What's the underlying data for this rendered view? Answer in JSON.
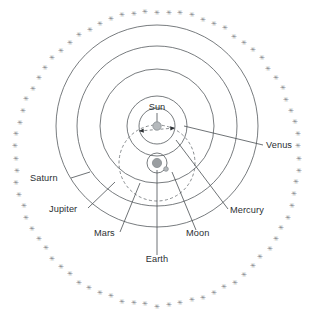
{
  "diagram": {
    "type": "geocentric-heliocentric hybrid orbital diagram",
    "center_x": 157,
    "center_y": 163,
    "sun_x": 157,
    "sun_y": 126,
    "colors": {
      "background": "#ffffff",
      "orbit_stroke": "#555a5e",
      "dashed_stroke": "#6b7074",
      "leader_stroke": "#4a4f53",
      "label_text": "#2b2f33",
      "star_fill": "#7e8286",
      "body_fill": "#b5b9bc",
      "body_stroke": "#8a8f93"
    },
    "labels": [
      {
        "id": "sun",
        "text": "Sun",
        "x": 157,
        "y": 110,
        "anchor": "middle",
        "leader": [
          [
            157,
            113
          ],
          [
            157,
            122
          ]
        ]
      },
      {
        "id": "venus",
        "text": "Venus",
        "x": 266,
        "y": 148,
        "anchor": "start",
        "leader": [
          [
            263,
            145
          ],
          [
            184,
            126
          ]
        ]
      },
      {
        "id": "mercury",
        "text": "Mercury",
        "x": 230,
        "y": 213,
        "anchor": "start",
        "leader": [
          [
            228,
            209
          ],
          [
            176,
            140
          ]
        ]
      },
      {
        "id": "saturn",
        "text": "Saturn",
        "x": 30,
        "y": 181,
        "anchor": "start",
        "leader": [
          [
            71,
            178
          ],
          [
            90,
            172
          ]
        ]
      },
      {
        "id": "jupiter",
        "text": "Jupiter",
        "x": 49,
        "y": 212,
        "anchor": "start",
        "leader": [
          [
            88,
            208
          ],
          [
            115,
            182
          ]
        ]
      },
      {
        "id": "mars",
        "text": "Mars",
        "x": 94,
        "y": 236,
        "anchor": "start",
        "leader": [
          [
            120,
            232
          ],
          [
            140,
            183
          ]
        ]
      },
      {
        "id": "moon",
        "text": "Moon",
        "x": 186,
        "y": 236,
        "anchor": "start",
        "leader": [
          [
            196,
            230
          ],
          [
            172,
            172
          ]
        ]
      },
      {
        "id": "earth",
        "text": "Earth",
        "x": 157,
        "y": 262,
        "anchor": "middle",
        "leader": [
          [
            157,
            255
          ],
          [
            157,
            170
          ]
        ]
      }
    ],
    "orbits": [
      {
        "id": "mercury-orbit",
        "cx": 157,
        "cy": 126,
        "r": 18,
        "style": "solid"
      },
      {
        "id": "venus-orbit",
        "cx": 157,
        "cy": 126,
        "r": 30,
        "style": "solid"
      },
      {
        "id": "mars-orbit",
        "cx": 157,
        "cy": 126,
        "r": 57,
        "style": "solid"
      },
      {
        "id": "jupiter-orbit",
        "cx": 157,
        "cy": 126,
        "r": 80,
        "style": "solid"
      },
      {
        "id": "saturn-orbit",
        "cx": 157,
        "cy": 126,
        "r": 101,
        "style": "solid"
      },
      {
        "id": "sun-orbit-around-earth",
        "cx": 157,
        "cy": 163,
        "r": 38,
        "style": "dashed"
      },
      {
        "id": "moon-orbit",
        "cx": 157,
        "cy": 163,
        "r": 10,
        "style": "solid"
      }
    ],
    "bodies": [
      {
        "id": "sun-body",
        "cx": 157,
        "cy": 126,
        "r": 4.2,
        "fill": "#b5b9bc"
      },
      {
        "id": "earth-body",
        "cx": 157,
        "cy": 163,
        "r": 4.6,
        "fill": "#9a9ea1"
      },
      {
        "id": "moon-body",
        "cx": 166,
        "cy": 169,
        "r": 2.3,
        "fill": "#b5b9bc"
      }
    ],
    "sun_axis": {
      "id": "mercury-orbit-axis",
      "from": [
        139,
        131
      ],
      "to": [
        175,
        128
      ],
      "has_arrow_left": true,
      "has_arrow_right": true
    },
    "star_ring": {
      "id": "fixed-stars-ring",
      "glyph": "✳",
      "glyph_name": "star-glyph",
      "count": 76,
      "cx": 157,
      "cy": 158,
      "rx": 142,
      "ry": 147
    }
  }
}
